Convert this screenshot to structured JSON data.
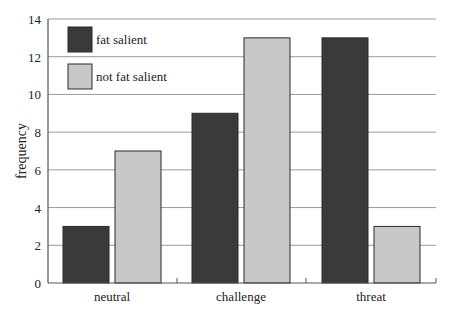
{
  "chart_data": {
    "type": "bar",
    "title": "",
    "xlabel": "",
    "ylabel": "frequency",
    "categories": [
      "neutral",
      "challenge",
      "threat"
    ],
    "series": [
      {
        "name": "fat salient",
        "values": [
          3,
          9,
          13
        ],
        "color": "#3a3a3a"
      },
      {
        "name": "not fat salient",
        "values": [
          7,
          13,
          3
        ],
        "color": "#c8c8c8"
      }
    ],
    "ylim": [
      0,
      14
    ],
    "yticks": [
      0,
      2,
      4,
      6,
      8,
      10,
      12,
      14
    ],
    "grid": true,
    "legend_position": "top-left inside"
  }
}
